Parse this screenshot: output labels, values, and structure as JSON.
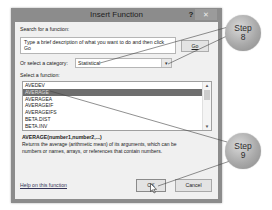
{
  "dialog": {
    "title": "Insert Function",
    "help_glyph": "?",
    "close_glyph": "✕",
    "search": {
      "label": "Search for a function:",
      "value": "Type a brief description of what you want to do and then click Go",
      "go_label": "Go"
    },
    "category": {
      "label": "Or select a category:",
      "selected": "Statistical",
      "arrow_glyph": "▾"
    },
    "functions": {
      "label": "Select a function:",
      "items": [
        {
          "name": "AVEDEV",
          "selected": false
        },
        {
          "name": "AVERAGE",
          "selected": true
        },
        {
          "name": "AVERAGEA",
          "selected": false
        },
        {
          "name": "AVERAGEIF",
          "selected": false
        },
        {
          "name": "AVERAGEIFS",
          "selected": false
        },
        {
          "name": "BETA.DIST",
          "selected": false
        },
        {
          "name": "BETA.INV",
          "selected": false
        }
      ],
      "scroll_up_glyph": "▲",
      "scroll_down_glyph": "▼"
    },
    "signature": "AVERAGE(number1,number2,...)",
    "description": "Returns the average (arithmetic mean) of its arguments, which can be numbers or names, arrays, or references that contain numbers.",
    "help_link": "Help on this function",
    "ok_label": "OK",
    "cancel_label": "Cancel"
  },
  "callouts": [
    {
      "label": "Step",
      "number": "8"
    },
    {
      "label": "Step",
      "number": "9"
    }
  ],
  "colors": {
    "titlebar": "#8c8c8c",
    "client": "#f0f0f0",
    "selection": "#6e6e6e",
    "callout": "#a9a9a9"
  }
}
